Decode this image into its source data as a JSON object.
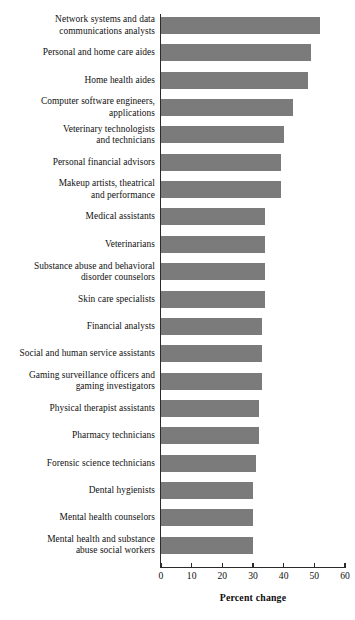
{
  "chart_data": {
    "type": "bar",
    "orientation": "horizontal",
    "title": "",
    "xlabel": "Percent change",
    "ylabel": "",
    "xlim": [
      0,
      60
    ],
    "xticks": [
      0,
      10,
      20,
      30,
      40,
      50,
      60
    ],
    "xtick_labels": [
      "0",
      "10",
      "20",
      "30",
      "40",
      "50",
      "60"
    ],
    "grid": false,
    "legend": false,
    "bar_color": "#7b7b7b",
    "axis_color": "#2b2b2b",
    "categories": [
      "Network systems and data\ncommunications analysts",
      "Personal and home care aides",
      "Home health aides",
      "Computer software engineers,\napplications",
      "Veterinary technologists\nand technicians",
      "Personal financial advisors",
      "Makeup artists, theatrical\nand performance",
      "Medical assistants",
      "Veterinarians",
      "Substance abuse and behavioral\ndisorder counselors",
      "Skin care specialists",
      "Financial analysts",
      "Social and human service assistants",
      "Gaming surveillance officers and\ngaming investigators",
      "Physical therapist assistants",
      "Pharmacy technicians",
      "Forensic science technicians",
      "Dental hygienists",
      "Mental health counselors",
      "Mental health and substance\nabuse social workers"
    ],
    "values": [
      52,
      49,
      48,
      43,
      40,
      39,
      39,
      34,
      34,
      34,
      34,
      33,
      33,
      33,
      32,
      32,
      31,
      30,
      30,
      30
    ]
  }
}
